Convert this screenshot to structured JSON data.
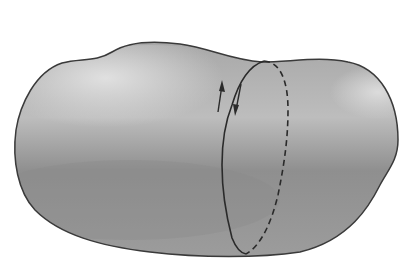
{
  "figure": {
    "colors": {
      "background": "#ffffff",
      "body_fill_light": "#d8d8d8",
      "body_fill_dark": "#8c8c8c",
      "outline": "#3a3a3a",
      "loop_line": "#2a2a2a"
    },
    "arrows": [
      {
        "name": "up-arrow",
        "direction": "up"
      },
      {
        "name": "down-arrow",
        "direction": "down"
      }
    ]
  }
}
